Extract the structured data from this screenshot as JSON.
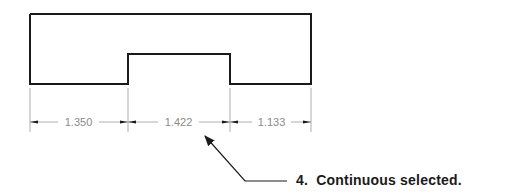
{
  "figure": {
    "type": "technical-drawing",
    "object_outline": {
      "stroke_color": "#1a1a1a",
      "stroke_width": 2,
      "points": [
        [
          30,
          14
        ],
        [
          311,
          14
        ],
        [
          311,
          84
        ],
        [
          230,
          84
        ],
        [
          230,
          54
        ],
        [
          128,
          54
        ],
        [
          128,
          84
        ],
        [
          30,
          84
        ]
      ]
    },
    "dimension_style": {
      "line_color": "#9a9a9a",
      "arrow_color": "#1a1a1a",
      "text_color": "#8a8a8a"
    },
    "dimensions": [
      {
        "label": "1.350",
        "x1": 30,
        "x2": 128
      },
      {
        "label": "1.422",
        "x1": 128,
        "x2": 230
      },
      {
        "label": "1.133",
        "x1": 230,
        "x2": 311
      }
    ],
    "dimension_line_y": 122,
    "leader": {
      "arrow_tip": [
        205,
        136
      ],
      "bend": [
        245,
        181
      ],
      "end": [
        287,
        181
      ],
      "color": "#1a1a1a"
    },
    "callout": {
      "number": "4.",
      "text": "Continuous selected.",
      "full": "4.  Continuous selected."
    }
  }
}
